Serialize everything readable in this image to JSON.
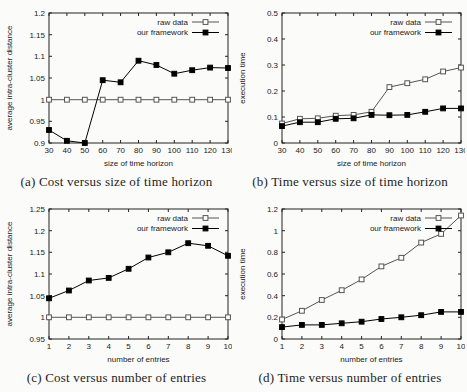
{
  "figure": {
    "background": "#fbfbf9",
    "ink": "#222222",
    "legend_labels": [
      "raw data",
      "our framework"
    ]
  },
  "chart_data": [
    {
      "id": "a",
      "type": "line",
      "caption": "(a) Cost versus size of time horizon",
      "xlabel": "size of time horizon",
      "ylabel": "average intra-cluster distance",
      "x": [
        30,
        40,
        50,
        60,
        70,
        80,
        90,
        100,
        110,
        120,
        130
      ],
      "xtick_labels": [
        "30",
        "40",
        "50",
        "60",
        "70",
        "80",
        "90",
        "100",
        "110",
        "120",
        "130"
      ],
      "xlim": [
        30,
        130
      ],
      "ylim": [
        0.9,
        1.2
      ],
      "yticks": [
        0.9,
        0.95,
        1.0,
        1.05,
        1.1,
        1.15,
        1.2
      ],
      "ytick_labels": [
        "0.9",
        "0.95",
        "1",
        "1.05",
        "1.1",
        "1.15",
        "1.2"
      ],
      "grid": false,
      "legend_position": "top-right-inside",
      "series": [
        {
          "name": "raw data",
          "marker": "open-square",
          "color": "#555555",
          "values": [
            1.0,
            1.0,
            1.0,
            1.0,
            1.0,
            1.0,
            1.0,
            1.0,
            1.0,
            1.0,
            1.0
          ]
        },
        {
          "name": "our framework",
          "marker": "filled-square",
          "color": "#000000",
          "values": [
            0.93,
            0.905,
            0.9,
            1.045,
            1.04,
            1.09,
            1.08,
            1.06,
            1.068,
            1.074,
            1.073
          ]
        }
      ]
    },
    {
      "id": "b",
      "type": "line",
      "caption": "(b) Time versus size of time horizon",
      "xlabel": "size of time horizon",
      "ylabel": "execution time",
      "x": [
        30,
        40,
        50,
        60,
        70,
        80,
        90,
        100,
        110,
        120,
        130
      ],
      "xtick_labels": [
        "30",
        "40",
        "50",
        "60",
        "70",
        "80",
        "90",
        "100",
        "110",
        "120",
        "130"
      ],
      "xlim": [
        30,
        130
      ],
      "ylim": [
        0,
        0.5
      ],
      "yticks": [
        0,
        0.1,
        0.2,
        0.3,
        0.4,
        0.5
      ],
      "ytick_labels": [
        "0",
        "0.1",
        "0.2",
        "0.3",
        "0.4",
        "0.5"
      ],
      "grid": false,
      "legend_position": "top-right-inside",
      "series": [
        {
          "name": "raw data",
          "marker": "open-square",
          "color": "#555555",
          "values": [
            0.075,
            0.093,
            0.095,
            0.105,
            0.108,
            0.12,
            0.215,
            0.23,
            0.245,
            0.275,
            0.29
          ]
        },
        {
          "name": "our framework",
          "marker": "filled-square",
          "color": "#000000",
          "values": [
            0.065,
            0.08,
            0.08,
            0.093,
            0.095,
            0.108,
            0.107,
            0.108,
            0.12,
            0.133,
            0.133
          ]
        }
      ]
    },
    {
      "id": "c",
      "type": "line",
      "caption": "(c) Cost versus number of entries",
      "xlabel": "number of entries",
      "ylabel": "average intra-cluster distance",
      "x": [
        1,
        2,
        3,
        4,
        5,
        6,
        7,
        8,
        9,
        10
      ],
      "xtick_labels": [
        "1",
        "2",
        "3",
        "4",
        "5",
        "6",
        "7",
        "8",
        "9",
        "10"
      ],
      "xlim": [
        1,
        10
      ],
      "ylim": [
        0.95,
        1.25
      ],
      "yticks": [
        0.95,
        1.0,
        1.05,
        1.1,
        1.15,
        1.2,
        1.25
      ],
      "ytick_labels": [
        "0.95",
        "1",
        "1.05",
        "1.1",
        "1.15",
        "1.2",
        "1.25"
      ],
      "grid": false,
      "legend_position": "top-right-inside",
      "series": [
        {
          "name": "raw data",
          "marker": "open-square",
          "color": "#555555",
          "values": [
            1.0,
            1.0,
            1.0,
            1.0,
            1.0,
            1.0,
            1.0,
            1.0,
            1.0,
            1.0
          ]
        },
        {
          "name": "our framework",
          "marker": "filled-square",
          "color": "#000000",
          "values": [
            1.044,
            1.062,
            1.085,
            1.091,
            1.112,
            1.138,
            1.15,
            1.171,
            1.165,
            1.142
          ]
        }
      ]
    },
    {
      "id": "d",
      "type": "line",
      "caption": "(d) Time versus number of entries",
      "xlabel": "number of entries",
      "ylabel": "execution time",
      "x": [
        1,
        2,
        3,
        4,
        5,
        6,
        7,
        8,
        9,
        10
      ],
      "xtick_labels": [
        "1",
        "2",
        "3",
        "4",
        "5",
        "6",
        "7",
        "8",
        "9",
        "10"
      ],
      "xlim": [
        1,
        10
      ],
      "ylim": [
        0,
        1.2
      ],
      "yticks": [
        0,
        0.2,
        0.4,
        0.6,
        0.8,
        1.0,
        1.2
      ],
      "ytick_labels": [
        "0",
        "0.2",
        "0.4",
        "0.6",
        "0.8",
        "1",
        "1.2"
      ],
      "grid": false,
      "legend_position": "top-right-inside",
      "series": [
        {
          "name": "raw data",
          "marker": "open-square",
          "color": "#555555",
          "values": [
            0.18,
            0.26,
            0.36,
            0.45,
            0.55,
            0.67,
            0.75,
            0.89,
            0.97,
            1.14
          ]
        },
        {
          "name": "our framework",
          "marker": "filled-square",
          "color": "#000000",
          "values": [
            0.11,
            0.13,
            0.13,
            0.145,
            0.16,
            0.185,
            0.2,
            0.22,
            0.25,
            0.25
          ]
        }
      ]
    }
  ]
}
